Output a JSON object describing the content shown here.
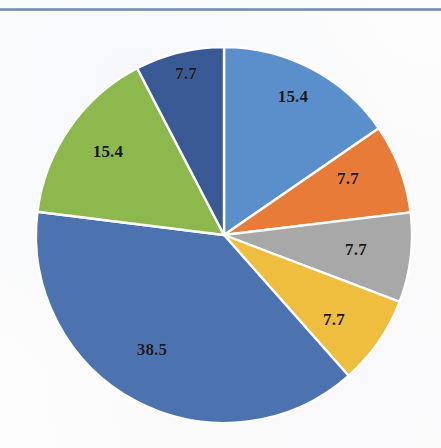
{
  "page": {
    "background_color": "#fdfdfd",
    "rule_color": "#6d82ae"
  },
  "chart_data": {
    "type": "pie",
    "title": "",
    "subtitle": "",
    "xlabel": "",
    "ylabel": "",
    "legend": "none",
    "grid": false,
    "start_angle_deg": 0,
    "direction": "clockwise",
    "total": 100.1,
    "label_suffix": "",
    "categories": [
      "Slice 1",
      "Slice 2",
      "Slice 3",
      "Slice 4",
      "Slice 5",
      "Slice 6",
      "Slice 7"
    ],
    "values": [
      15.4,
      7.7,
      7.7,
      7.7,
      38.5,
      15.4,
      7.7
    ],
    "labels": [
      "15.4",
      "7.7",
      "7.7",
      "7.7",
      "38.5",
      "15.4",
      "7.7"
    ],
    "colors": [
      "#5b8fcb",
      "#e87b38",
      "#a8a8a8",
      "#efbe3e",
      "#4c72b0",
      "#8cb84e",
      "#3a5a96"
    ],
    "slices": [
      {
        "name": "slice-1",
        "value": 15.4,
        "label": "15.4",
        "color": "#5b8fcb",
        "start_deg": 0.0,
        "sweep_deg": 55.4,
        "label_x": 293,
        "label_y": 83
      },
      {
        "name": "slice-2",
        "value": 7.7,
        "label": "7.7",
        "color": "#e87b38",
        "start_deg": 55.4,
        "sweep_deg": 27.7,
        "label_x": 348,
        "label_y": 165
      },
      {
        "name": "slice-3",
        "value": 7.7,
        "label": "7.7",
        "color": "#a8a8a8",
        "start_deg": 83.1,
        "sweep_deg": 27.7,
        "label_x": 356,
        "label_y": 236
      },
      {
        "name": "slice-4",
        "value": 7.7,
        "label": "7.7",
        "color": "#efbe3e",
        "start_deg": 110.8,
        "sweep_deg": 27.7,
        "label_x": 334,
        "label_y": 306
      },
      {
        "name": "slice-5",
        "value": 38.5,
        "label": "38.5",
        "color": "#4c72b0",
        "start_deg": 138.5,
        "sweep_deg": 138.6,
        "label_x": 152,
        "label_y": 336
      },
      {
        "name": "slice-6",
        "value": 15.4,
        "label": "15.4",
        "color": "#8cb84e",
        "start_deg": 277.1,
        "sweep_deg": 55.4,
        "label_x": 108,
        "label_y": 138
      },
      {
        "name": "slice-7",
        "value": 7.7,
        "label": "7.7",
        "color": "#3a5a96",
        "start_deg": 332.5,
        "sweep_deg": 27.5,
        "label_x": 186,
        "label_y": 60
      }
    ],
    "geometry": {
      "center_x": 224,
      "center_y": 221,
      "radius": 188,
      "separator_color": "#ffffff",
      "separator_width": 2.4
    }
  }
}
